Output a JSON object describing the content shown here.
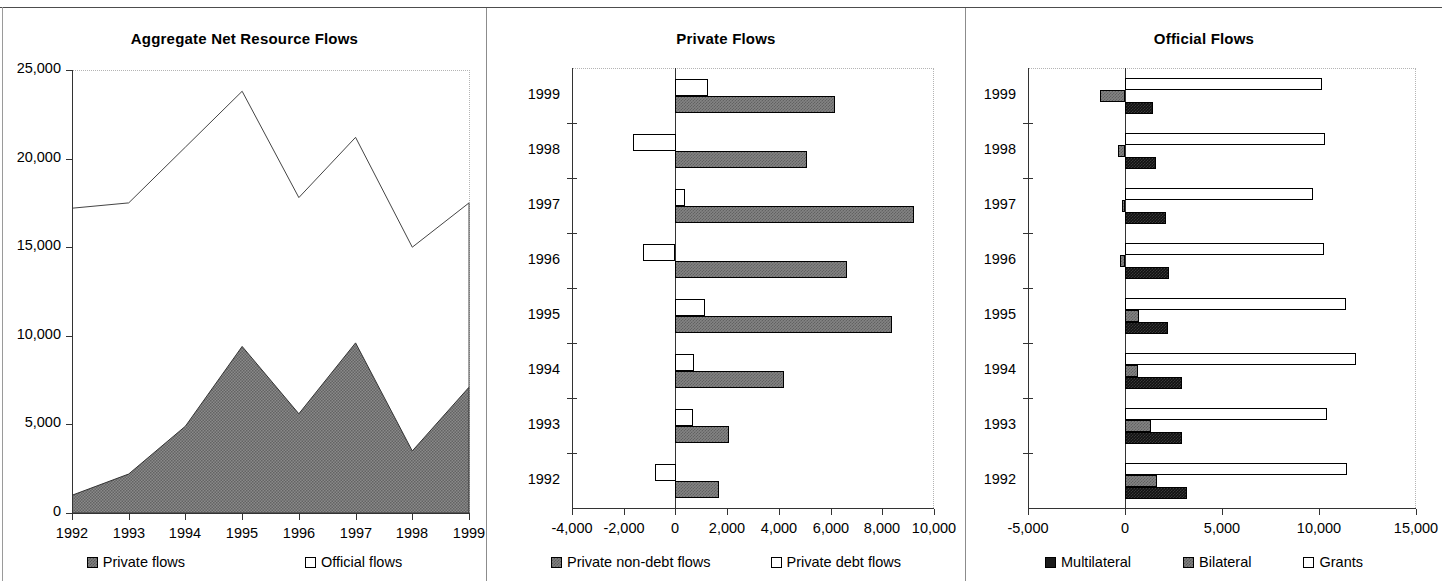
{
  "figure": {
    "panel_count": 3
  },
  "panels": {
    "aggregate": {
      "title": "Aggregate Net Resource Flows",
      "ylabel": "",
      "xlabel": "",
      "y_ticks": [
        "0",
        "5,000",
        "10,000",
        "15,000",
        "20,000",
        "25,000"
      ],
      "x_ticks": [
        "1992",
        "1993",
        "1994",
        "1995",
        "1996",
        "1997",
        "1998",
        "1999"
      ],
      "legend": [
        {
          "label": "Private flows",
          "swatch": "gray-hatch-swatch"
        },
        {
          "label": "Official flows",
          "swatch": "white-swatch"
        }
      ]
    },
    "private": {
      "title": "Private Flows",
      "x_ticks": [
        "-4,000",
        "-2,000",
        "0",
        "2,000",
        "4,000",
        "6,000",
        "8,000",
        "10,000"
      ],
      "y_ticks": [
        "1992",
        "1993",
        "1994",
        "1995",
        "1996",
        "1997",
        "1998",
        "1999"
      ],
      "legend": [
        {
          "label": "Private non-debt flows",
          "swatch": "gray-hatch-swatch"
        },
        {
          "label": "Private debt flows",
          "swatch": "white-swatch"
        }
      ]
    },
    "official": {
      "title": "Official Flows",
      "x_ticks": [
        "-5,000",
        "0",
        "5,000",
        "10,000",
        "15,000"
      ],
      "y_ticks": [
        "1992",
        "1993",
        "1994",
        "1995",
        "1996",
        "1997",
        "1998",
        "1999"
      ],
      "legend": [
        {
          "label": "Multilateral",
          "swatch": "black-swatch"
        },
        {
          "label": "Bilateral",
          "swatch": "gray-hatch-swatch"
        },
        {
          "label": "Grants",
          "swatch": "white-swatch"
        }
      ]
    }
  },
  "chart_data": [
    {
      "type": "area",
      "title": "Aggregate Net Resource Flows",
      "xlabel": "",
      "ylabel": "",
      "categories": [
        "1992",
        "1993",
        "1994",
        "1995",
        "1996",
        "1997",
        "1998",
        "1999"
      ],
      "ylim": [
        0,
        25000
      ],
      "ytick_values": [
        0,
        5000,
        10000,
        15000,
        20000,
        25000
      ],
      "grid": false,
      "legend_position": "bottom",
      "stacked": true,
      "series": [
        {
          "name": "Private flows",
          "fill": "gray-hatch",
          "values": [
            1000,
            2200,
            4900,
            9400,
            5600,
            9600,
            3500,
            7100
          ]
        },
        {
          "name": "Official flows",
          "fill": "white",
          "values": [
            16200,
            15300,
            15750,
            14400,
            12200,
            11600,
            11500,
            10400
          ]
        }
      ],
      "totals": [
        17200,
        17500,
        20650,
        23800,
        17800,
        21200,
        15000,
        17500
      ]
    },
    {
      "type": "bar",
      "orientation": "horizontal",
      "title": "Private Flows",
      "xlabel": "",
      "ylabel": "",
      "categories": [
        "1992",
        "1993",
        "1994",
        "1995",
        "1996",
        "1997",
        "1998",
        "1999"
      ],
      "xlim": [
        -4000,
        10000
      ],
      "xtick_values": [
        -4000,
        -2000,
        0,
        2000,
        4000,
        6000,
        8000,
        10000
      ],
      "grid": false,
      "legend_position": "bottom",
      "series": [
        {
          "name": "Private non-debt flows",
          "fill": "gray-hatch",
          "values": [
            1700,
            2100,
            4200,
            8400,
            6650,
            9250,
            5100,
            6180
          ]
        },
        {
          "name": "Private debt flows",
          "fill": "white",
          "values": [
            -800,
            700,
            750,
            1150,
            -1250,
            400,
            -1650,
            1270
          ]
        }
      ]
    },
    {
      "type": "bar",
      "orientation": "horizontal",
      "title": "Official Flows",
      "xlabel": "",
      "ylabel": "",
      "categories": [
        "1992",
        "1993",
        "1994",
        "1995",
        "1996",
        "1997",
        "1998",
        "1999"
      ],
      "xlim": [
        -5000,
        15000
      ],
      "xtick_values": [
        -5000,
        0,
        5000,
        10000,
        15000
      ],
      "grid": false,
      "legend_position": "bottom",
      "series": [
        {
          "name": "Multilateral",
          "fill": "black",
          "values": [
            3200,
            2950,
            2950,
            2200,
            2250,
            2100,
            1600,
            1450
          ]
        },
        {
          "name": "Bilateral",
          "fill": "gray-hatch",
          "values": [
            1650,
            1350,
            650,
            700,
            -250,
            -150,
            -350,
            -1300
          ]
        },
        {
          "name": "Grants",
          "fill": "white",
          "values": [
            11450,
            10400,
            11900,
            11400,
            10250,
            9700,
            10300,
            10150
          ]
        }
      ]
    }
  ]
}
